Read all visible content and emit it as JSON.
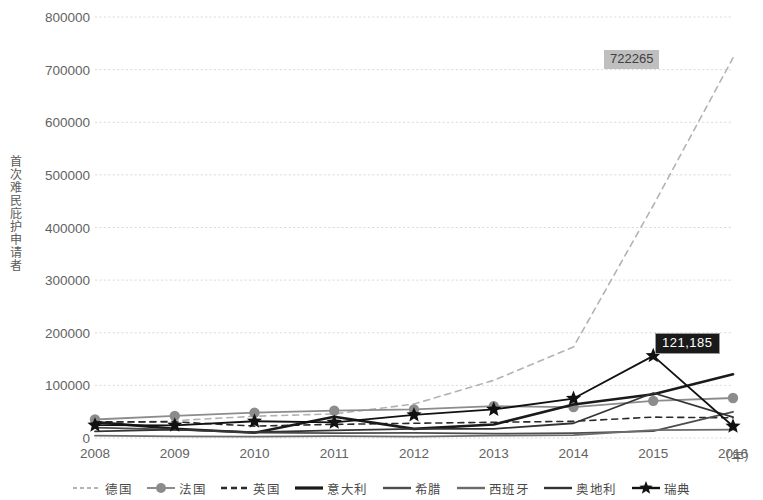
{
  "chart_data": {
    "type": "line",
    "title": "",
    "xlabel": "（年）",
    "ylabel": "首次难民庇护申请者",
    "x": [
      2008,
      2009,
      2010,
      2011,
      2012,
      2013,
      2014,
      2015,
      2016
    ],
    "xtick_labels": [
      "2008",
      "2009",
      "2010",
      "2011",
      "2012",
      "2013",
      "2014",
      "2015",
      "2016"
    ],
    "ytick_labels": [
      "0",
      "100000",
      "200000",
      "300000",
      "400000",
      "500000",
      "600000",
      "700000",
      "800000"
    ],
    "ytick_values": [
      0,
      100000,
      200000,
      300000,
      400000,
      500000,
      600000,
      700000,
      800000
    ],
    "ylim": [
      0,
      800000
    ],
    "xlim": [
      2008,
      2016
    ],
    "grid": true,
    "grid_style": "dotted",
    "legend_position": "bottom",
    "annotations": [
      {
        "name": "germany-2016-label",
        "text": "722265",
        "x": 2016,
        "y": 722265,
        "style": "gray-box"
      },
      {
        "name": "germany-2014-label",
        "text": "121,185",
        "x": 2014,
        "y": 121185,
        "style": "black-box"
      }
    ],
    "series": [
      {
        "name": "德国",
        "style": "dashed",
        "color": "#b3b3b3",
        "marker": "none",
        "values": [
          26845,
          32910,
          41330,
          45740,
          64540,
          109580,
          172945,
          441800,
          722265
        ]
      },
      {
        "name": "法国",
        "style": "solid",
        "color": "#8c8c8c",
        "marker": "circle",
        "values": [
          35160,
          41980,
          48075,
          51910,
          54265,
          60475,
          58845,
          70570,
          75990
        ]
      },
      {
        "name": "英国",
        "style": "dashed",
        "color": "#2b2b2b",
        "marker": "none",
        "values": [
          30545,
          30675,
          22645,
          25895,
          27980,
          29875,
          31745,
          39720,
          38290
        ]
      },
      {
        "name": "意大利",
        "style": "solid-thick",
        "color": "#1a1a1a",
        "marker": "none",
        "values": [
          30140,
          17670,
          10000,
          40315,
          17335,
          25720,
          63655,
          83245,
          121185
        ]
      },
      {
        "name": "希腊",
        "style": "solid",
        "color": "#4d4d4d",
        "marker": "none",
        "values": [
          19880,
          15925,
          10275,
          9310,
          9575,
          8225,
          9430,
          13195,
          49875
        ]
      },
      {
        "name": "西班牙",
        "style": "solid",
        "color": "#6b6b6b",
        "marker": "none",
        "values": [
          4515,
          3005,
          2740,
          3420,
          2565,
          4485,
          5615,
          14780,
          15755
        ]
      },
      {
        "name": "奥地利",
        "style": "solid",
        "color": "#333333",
        "marker": "none",
        "values": [
          12715,
          15780,
          11010,
          14420,
          17415,
          17500,
          28035,
          85505,
          39875
        ]
      },
      {
        "name": "瑞典",
        "style": "solid",
        "color": "#111111",
        "marker": "star",
        "values": [
          24350,
          24175,
          31850,
          29650,
          43855,
          54260,
          74980,
          156110,
          22330
        ]
      }
    ]
  },
  "axis": {
    "ylabel": "首次难民庇护申请者",
    "xunit": "（年）"
  },
  "legend": {
    "items": [
      {
        "label": "德国",
        "key": "dashed-light"
      },
      {
        "label": "法国",
        "key": "solid-circle"
      },
      {
        "label": "英国",
        "key": "dashed-dark"
      },
      {
        "label": "意大利",
        "key": "solid-thick"
      },
      {
        "label": "希腊",
        "key": "solid-med"
      },
      {
        "label": "西班牙",
        "key": "solid-gray"
      },
      {
        "label": "奥地利",
        "key": "solid-dark"
      },
      {
        "label": "瑞典",
        "key": "solid-star"
      }
    ]
  },
  "labels": {
    "germany_2016": "722265",
    "italy_2016": "121,185"
  }
}
